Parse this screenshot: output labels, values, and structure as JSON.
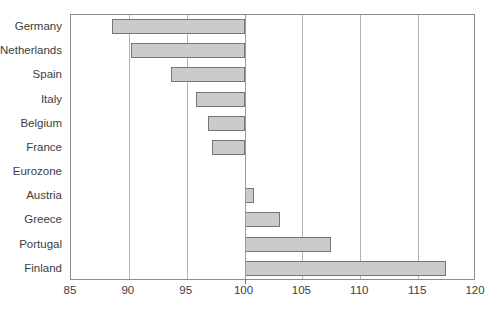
{
  "chart_data": {
    "type": "bar",
    "orientation": "horizontal",
    "title": "",
    "subtitle": "",
    "xlabel": "",
    "ylabel": "",
    "xlim": [
      85,
      120
    ],
    "ylim": null,
    "grid": true,
    "gridlines_axis": "x",
    "legend": false,
    "legend_position": "none",
    "baseline": 100,
    "xticks": [
      85,
      90,
      95,
      100,
      105,
      110,
      115,
      120
    ],
    "xtick_labels": [
      "85",
      "90",
      "95",
      "100",
      "105",
      "110",
      "115",
      "120"
    ],
    "categories": [
      "Germany",
      "Netherlands",
      "Spain",
      "Italy",
      "Belgium",
      "France",
      "Eurozone",
      "Austria",
      "Greece",
      "Portugal",
      "Finland"
    ],
    "values": [
      88.5,
      90.2,
      93.6,
      95.8,
      96.8,
      97.2,
      100.0,
      100.8,
      103.1,
      107.5,
      117.4
    ],
    "series": [
      {
        "name": "Index",
        "values": [
          88.5,
          90.2,
          93.6,
          95.8,
          96.8,
          97.2,
          100.0,
          100.8,
          103.1,
          107.5,
          117.4
        ]
      }
    ],
    "colors": {
      "bar_fill": "#cbcbcb",
      "bar_border": "#757575",
      "gridline": "#b4b4b4",
      "axis": "#8c8c8c",
      "text": "#3d3d3d",
      "background": "#ffffff"
    }
  }
}
